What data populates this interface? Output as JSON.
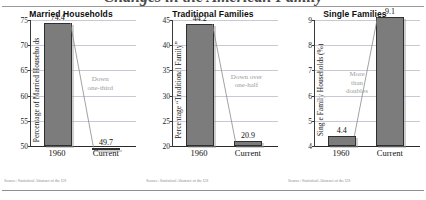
{
  "page": {
    "cutoff_title": "Changes in the American Family",
    "source_note": "Source: Statistical Abstract of the US"
  },
  "chart_data": [
    {
      "type": "bar",
      "title": "Married Households",
      "ylabel": "Percentage of Married Households",
      "xlabel": "",
      "categories": [
        "1960",
        "Current"
      ],
      "values": [
        74.4,
        49.7
      ],
      "value_labels": [
        "74.4",
        "49.7"
      ],
      "ylim": [
        50,
        75
      ],
      "yticks": [
        50,
        55,
        60,
        65,
        70,
        75
      ],
      "ytick_labels": [
        "50",
        "55",
        "60",
        "65",
        "70",
        "75"
      ],
      "grid": true,
      "annotation": [
        "Down",
        "one-third"
      ],
      "source": "Source: Statistical Abstract of the US"
    },
    {
      "type": "bar",
      "title": "Traditional Families",
      "ylabel": "Percentage “Traditional Family”",
      "xlabel": "",
      "categories": [
        "1960",
        "Current"
      ],
      "values": [
        44.2,
        20.9
      ],
      "value_labels": [
        "44.2",
        "20.9"
      ],
      "ylim": [
        20,
        45
      ],
      "yticks": [
        20,
        25,
        30,
        35,
        40,
        45
      ],
      "ytick_labels": [
        "20",
        "25",
        "30",
        "35",
        "40",
        "45"
      ],
      "grid": true,
      "annotation": [
        "Down over",
        "one-half"
      ],
      "source": "Source: Statistical Abstract of the US"
    },
    {
      "type": "bar",
      "title": "Single Families",
      "ylabel": "Single Family Households (%)",
      "xlabel": "",
      "categories": [
        "1960",
        "Current"
      ],
      "values": [
        4.4,
        9.1
      ],
      "value_labels": [
        "4.4",
        "9.1"
      ],
      "ylim": [
        4,
        9
      ],
      "yticks": [
        4,
        5,
        6,
        7,
        8,
        9
      ],
      "ytick_labels": [
        "4",
        "5",
        "6",
        "7",
        "8",
        "9"
      ],
      "grid": true,
      "annotation": [
        "More",
        "than",
        "doubles"
      ],
      "source": "Source: Statistical Abstract of the US"
    }
  ],
  "colors": {
    "bar_fill": "#7c7c7c",
    "bar_stroke": "#2f2f2f",
    "gridline": "#c9c9d6",
    "annotation": "#9c9c9c",
    "axis": "#2a2a2a"
  }
}
